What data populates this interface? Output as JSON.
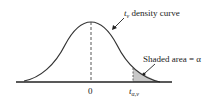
{
  "diagram": {
    "curve_label_var": "t",
    "curve_label_sub": "ν",
    "curve_label_text": " density curve",
    "shaded_label": "Shaded area = α",
    "zero_label": "0",
    "crit_label_var": "t",
    "crit_label_sub": "α,ν",
    "colors": {
      "curve": "#333333",
      "shade": "#c8c8c8",
      "axis": "#222222"
    }
  }
}
